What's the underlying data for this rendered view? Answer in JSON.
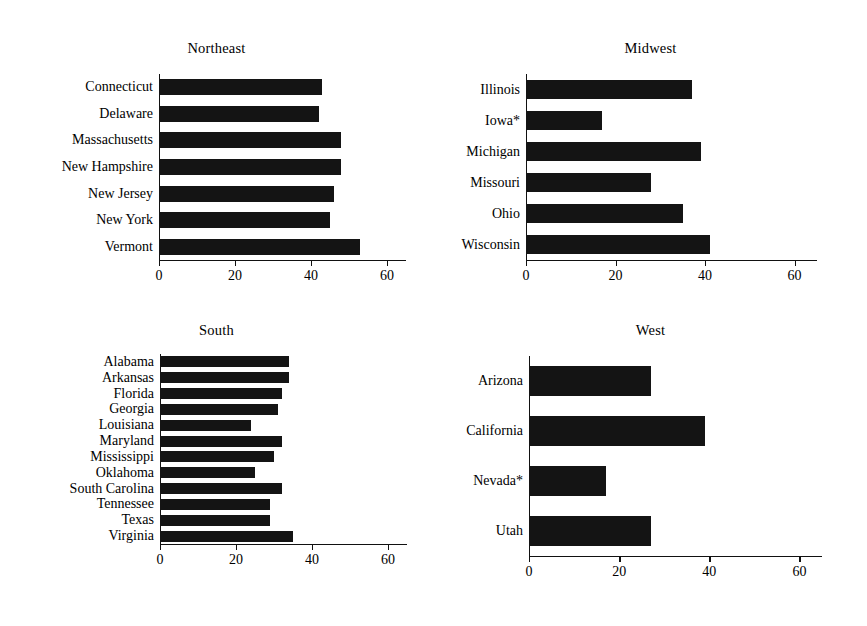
{
  "figure": {
    "cropped_title_remnant": "",
    "axis_max": 65,
    "bar_color": "#141414",
    "axis_color": "#111111"
  },
  "chart_data": [
    {
      "type": "bar",
      "orientation": "horizontal",
      "title": "Northeast",
      "xlabel": "",
      "ylabel": "",
      "xlim": [
        0,
        65
      ],
      "grid": false,
      "legend": null,
      "ticks": [
        0,
        20,
        40,
        60
      ],
      "tick_labels": [
        "0",
        "20",
        "40",
        "60"
      ],
      "categories": [
        "Connecticut",
        "Delaware",
        "Massachusetts",
        "New Hampshire",
        "New Jersey",
        "New York",
        "Vermont"
      ],
      "values": [
        43,
        42,
        48,
        48,
        46,
        45,
        53
      ]
    },
    {
      "type": "bar",
      "orientation": "horizontal",
      "title": "Midwest",
      "xlabel": "",
      "ylabel": "",
      "xlim": [
        0,
        65
      ],
      "grid": false,
      "legend": null,
      "ticks": [
        0,
        20,
        40,
        60
      ],
      "tick_labels": [
        "0",
        "20",
        "40",
        "60"
      ],
      "categories": [
        "Illinois",
        "Iowa*",
        "Michigan",
        "Missouri",
        "Ohio",
        "Wisconsin"
      ],
      "values": [
        37,
        17,
        39,
        28,
        35,
        41
      ]
    },
    {
      "type": "bar",
      "orientation": "horizontal",
      "title": "South",
      "xlabel": "",
      "ylabel": "",
      "xlim": [
        0,
        65
      ],
      "grid": false,
      "legend": null,
      "ticks": [
        0,
        20,
        40,
        60
      ],
      "tick_labels": [
        "0",
        "20",
        "40",
        "60"
      ],
      "categories": [
        "Alabama",
        "Arkansas",
        "Florida",
        "Georgia",
        "Louisiana",
        "Maryland",
        "Mississippi",
        "Oklahoma",
        "South Carolina",
        "Tennessee",
        "Texas",
        "Virginia"
      ],
      "values": [
        34,
        34,
        32,
        31,
        24,
        32,
        30,
        25,
        32,
        29,
        29,
        35
      ]
    },
    {
      "type": "bar",
      "orientation": "horizontal",
      "title": "West",
      "xlabel": "",
      "ylabel": "",
      "xlim": [
        0,
        65
      ],
      "grid": false,
      "legend": null,
      "ticks": [
        0,
        20,
        40,
        60
      ],
      "tick_labels": [
        "0",
        "20",
        "40",
        "60"
      ],
      "categories": [
        "Arizona",
        "California",
        "Nevada*",
        "Utah"
      ],
      "values": [
        27,
        39,
        17,
        27
      ]
    }
  ]
}
